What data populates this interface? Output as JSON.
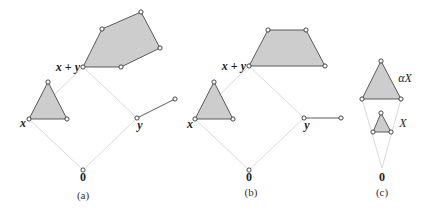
{
  "figure": {
    "colors": {
      "fill": "#cdcdcd",
      "stroke": "#4a4a4a",
      "guide": "#dadada",
      "point_fill": "#ffffff"
    },
    "panels": [
      {
        "id": "a",
        "caption": "(a)",
        "caption_pos": [
          83,
          199
        ],
        "guides": [
          [
            [
              83,
              170
            ],
            [
              29,
              119
            ]
          ],
          [
            [
              83,
              170
            ],
            [
              137,
              118
            ]
          ],
          [
            [
              29,
              119
            ],
            [
              83,
              67
            ]
          ],
          [
            [
              137,
              118
            ],
            [
              83,
              67
            ]
          ]
        ],
        "polygons": [
          {
            "name": "set-x-triangle",
            "points": [
              [
                29,
                119
              ],
              [
                48,
                82
              ],
              [
                67,
                119
              ]
            ]
          },
          {
            "name": "set-x-plus-y-polygon",
            "points": [
              [
                83,
                67
              ],
              [
                102,
                29
              ],
              [
                141,
                12
              ],
              [
                160,
                48
              ],
              [
                121,
                67
              ]
            ]
          }
        ],
        "segments": [
          {
            "name": "set-y-segment",
            "points": [
              [
                137,
                118
              ],
              [
                175,
                99
              ]
            ]
          }
        ],
        "points": [
          [
            83,
            170
          ],
          [
            29,
            119
          ],
          [
            48,
            82
          ],
          [
            67,
            119
          ],
          [
            137,
            118
          ],
          [
            175,
            99
          ],
          [
            83,
            67
          ],
          [
            102,
            29
          ],
          [
            141,
            12
          ],
          [
            160,
            48
          ],
          [
            121,
            67
          ]
        ],
        "labels": [
          {
            "name": "label-x",
            "text": "x",
            "pos": [
              23,
              127
            ],
            "cls": "vlabel",
            "anchor": "middle"
          },
          {
            "name": "label-y",
            "text": "y",
            "pos": [
              140,
              129
            ],
            "cls": "vlabel",
            "anchor": "middle"
          },
          {
            "name": "label-x-plus-y",
            "text": "x + y",
            "pos": [
              80,
              71
            ],
            "cls": "vlabel",
            "anchor": "end"
          },
          {
            "name": "label-origin",
            "text": "0",
            "pos": [
              83,
              181
            ],
            "cls": "zero",
            "anchor": "middle"
          }
        ]
      },
      {
        "id": "b",
        "caption": "(b)",
        "caption_pos": [
          251,
          196
        ],
        "guides": [
          [
            [
              249,
              170
            ],
            [
              195,
              119
            ]
          ],
          [
            [
              249,
              170
            ],
            [
              304,
              118
            ]
          ],
          [
            [
              195,
              119
            ],
            [
              249,
              66
            ]
          ],
          [
            [
              304,
              118
            ],
            [
              249,
              66
            ]
          ]
        ],
        "polygons": [
          {
            "name": "set-x-triangle",
            "points": [
              [
                195,
                119
              ],
              [
                214,
                82
              ],
              [
                233,
                119
              ]
            ]
          },
          {
            "name": "set-x-plus-y-trapezoid",
            "points": [
              [
                249,
                66
              ],
              [
                268,
                30
              ],
              [
                306,
                30
              ],
              [
                325,
                66
              ]
            ]
          }
        ],
        "segments": [
          {
            "name": "set-y-segment",
            "points": [
              [
                304,
                118
              ],
              [
                341,
                118
              ]
            ]
          }
        ],
        "points": [
          [
            249,
            170
          ],
          [
            195,
            119
          ],
          [
            214,
            82
          ],
          [
            233,
            119
          ],
          [
            304,
            118
          ],
          [
            341,
            118
          ],
          [
            249,
            66
          ],
          [
            268,
            30
          ],
          [
            306,
            30
          ],
          [
            325,
            66
          ]
        ],
        "labels": [
          {
            "name": "label-x",
            "text": "x",
            "pos": [
              190,
              128
            ],
            "cls": "vlabel",
            "anchor": "middle"
          },
          {
            "name": "label-y",
            "text": "y",
            "pos": [
              307,
              129
            ],
            "cls": "vlabel",
            "anchor": "middle"
          },
          {
            "name": "label-x-plus-y",
            "text": "x + y",
            "pos": [
              246,
              70
            ],
            "cls": "vlabel",
            "anchor": "end"
          },
          {
            "name": "label-origin",
            "text": "0",
            "pos": [
              249,
              181
            ],
            "cls": "zero",
            "anchor": "middle"
          }
        ]
      },
      {
        "id": "c",
        "caption": "(c)",
        "caption_pos": [
          382,
          196
        ],
        "guides": [
          [
            [
              382,
              168
            ],
            [
              362,
              99
            ]
          ],
          [
            [
              382,
              168
            ],
            [
              401,
              99
            ]
          ]
        ],
        "polygons": [
          {
            "name": "set-alpha-x-triangle",
            "points": [
              [
                381,
                61
              ],
              [
                362,
                99
              ],
              [
                401,
                99
              ]
            ]
          },
          {
            "name": "set-x-triangle",
            "points": [
              [
                381,
                113
              ],
              [
                373,
                132
              ],
              [
                391,
                132
              ]
            ]
          }
        ],
        "segments": [],
        "points": [
          [
            381,
            61
          ],
          [
            362,
            99
          ],
          [
            401,
            99
          ],
          [
            381,
            113
          ],
          [
            373,
            132
          ],
          [
            391,
            132
          ]
        ],
        "labels": [
          {
            "name": "label-alpha-x",
            "text": "αX",
            "pos": [
              405,
              82
            ],
            "cls": "setlabel",
            "anchor": "middle"
          },
          {
            "name": "label-x-set",
            "text": "X",
            "pos": [
              403,
              127
            ],
            "cls": "setlabel",
            "anchor": "middle"
          },
          {
            "name": "label-origin",
            "text": "0",
            "pos": [
              382,
              181
            ],
            "cls": "zero",
            "anchor": "middle"
          }
        ]
      }
    ]
  }
}
